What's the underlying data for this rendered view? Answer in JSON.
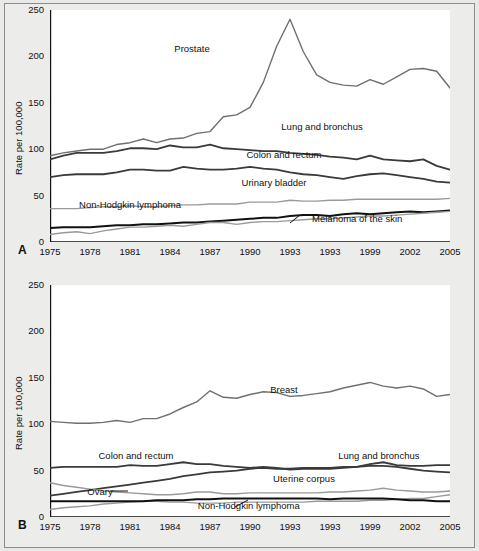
{
  "figure": {
    "background_color": "#e9e9e7",
    "plot_background_color": "#ffffff",
    "border_color": "#8c8c8a"
  },
  "panels": [
    {
      "letter": "A",
      "ylabel": "Rate per 100,000",
      "yticks": [
        "0",
        "50",
        "100",
        "150",
        "200",
        "250"
      ],
      "xticks": [
        "1975",
        "1978",
        "1981",
        "1984",
        "1987",
        "1990",
        "1993",
        "1993",
        "1999",
        "2002",
        "2005"
      ],
      "labels": [
        {
          "text": "Prostate",
          "x": 0.355,
          "y": 0.165
        },
        {
          "text": "Lung and bronchus",
          "x": 0.68,
          "y": 0.498
        },
        {
          "text": "Colon and rectum",
          "x": 0.585,
          "y": 0.62
        },
        {
          "text": "Urinary bladder",
          "x": 0.56,
          "y": 0.74
        },
        {
          "text": "Non-Hodgkin lymphoma",
          "x": 0.2,
          "y": 0.838
        },
        {
          "text": "Melanoma of the skin",
          "x": 0.768,
          "y": 0.898
        }
      ]
    },
    {
      "letter": "B",
      "ylabel": "Rate per 100,000",
      "yticks": [
        "0",
        "50",
        "100",
        "150",
        "200",
        "250"
      ],
      "xticks": [
        "1975",
        "1978",
        "1981",
        "1984",
        "1987",
        "1990",
        "1993",
        "1993",
        "1999",
        "2002",
        "2005"
      ],
      "labels": [
        {
          "text": "Breast",
          "x": 0.585,
          "y": 0.45
        },
        {
          "text": "Colon and rectum",
          "x": 0.215,
          "y": 0.733
        },
        {
          "text": "Lung and bronchus",
          "x": 0.822,
          "y": 0.733
        },
        {
          "text": "Uterine corpus",
          "x": 0.635,
          "y": 0.832
        },
        {
          "text": "Ovary",
          "x": 0.125,
          "y": 0.89
        },
        {
          "text": "Non-Hodgkin lymphoma",
          "x": 0.497,
          "y": 0.948
        }
      ]
    }
  ],
  "chart_data": [
    {
      "type": "line",
      "panel": "A",
      "title": "",
      "xlabel": "",
      "ylabel": "Rate per 100,000",
      "xlim": [
        1975,
        2005
      ],
      "ylim": [
        0,
        250
      ],
      "grid": false,
      "legend": "inline-labels",
      "x": [
        1975,
        1976,
        1977,
        1978,
        1979,
        1980,
        1981,
        1982,
        1983,
        1984,
        1985,
        1986,
        1987,
        1988,
        1989,
        1990,
        1991,
        1992,
        1993,
        1994,
        1995,
        1996,
        1997,
        1998,
        1999,
        2000,
        2001,
        2002,
        2003,
        2004,
        2005
      ],
      "series": [
        {
          "name": "Prostate",
          "color": "#6f6f6f",
          "width": 1.4,
          "values": [
            93,
            96,
            98,
            100,
            100,
            105,
            107,
            111,
            107,
            111,
            112,
            117,
            119,
            135,
            137,
            145,
            172,
            211,
            240,
            205,
            180,
            172,
            169,
            168,
            175,
            170,
            178,
            186,
            187,
            184,
            166
          ]
        },
        {
          "name": "Lung and bronchus",
          "color": "#3a3a3a",
          "width": 1.8,
          "values": [
            89,
            93,
            96,
            96,
            96,
            98,
            101,
            101,
            100,
            104,
            102,
            102,
            105,
            101,
            100,
            99,
            98,
            98,
            96,
            95,
            94,
            92,
            91,
            89,
            93,
            89,
            88,
            87,
            89,
            82,
            78
          ]
        },
        {
          "name": "Colon and rectum",
          "color": "#3a3a3a",
          "width": 1.8,
          "values": [
            70,
            72,
            73,
            73,
            73,
            75,
            78,
            78,
            77,
            77,
            81,
            79,
            78,
            78,
            79,
            81,
            79,
            78,
            75,
            73,
            72,
            70,
            68,
            71,
            73,
            74,
            72,
            70,
            68,
            65,
            64
          ]
        },
        {
          "name": "Urinary bladder",
          "color": "#9a9a9a",
          "width": 1.4,
          "values": [
            36,
            36,
            36,
            37,
            38,
            38,
            39,
            38,
            38,
            39,
            40,
            40,
            41,
            41,
            41,
            43,
            43,
            43,
            45,
            44,
            44,
            45,
            45,
            46,
            46,
            46,
            46,
            46,
            46,
            46,
            47
          ]
        },
        {
          "name": "Non-Hodgkin lymphoma",
          "color": "#111111",
          "width": 2.0,
          "values": [
            15,
            16,
            16,
            16,
            17,
            18,
            18,
            19,
            19,
            20,
            21,
            21,
            22,
            23,
            24,
            25,
            26,
            26,
            28,
            29,
            29,
            28,
            30,
            31,
            30,
            31,
            32,
            33,
            32,
            33,
            34
          ]
        },
        {
          "name": "Melanoma of the skin",
          "color": "#9a9a9a",
          "width": 1.4,
          "values": [
            8,
            10,
            11,
            9,
            12,
            14,
            16,
            16,
            17,
            18,
            17,
            19,
            21,
            21,
            19,
            21,
            22,
            22,
            23,
            24,
            25,
            25,
            26,
            27,
            28,
            28,
            29,
            30,
            31,
            32,
            33
          ]
        }
      ]
    },
    {
      "type": "line",
      "panel": "B",
      "title": "",
      "xlabel": "",
      "ylabel": "Rate per 100,000",
      "xlim": [
        1975,
        2005
      ],
      "ylim": [
        0,
        250
      ],
      "grid": false,
      "legend": "inline-labels",
      "x": [
        1975,
        1976,
        1977,
        1978,
        1979,
        1980,
        1981,
        1982,
        1983,
        1984,
        1985,
        1986,
        1987,
        1988,
        1989,
        1990,
        1991,
        1992,
        1993,
        1994,
        1995,
        1996,
        1997,
        1998,
        1999,
        2000,
        2001,
        2002,
        2003,
        2004,
        2005
      ],
      "series": [
        {
          "name": "Breast",
          "color": "#6f6f6f",
          "width": 1.4,
          "values": [
            103,
            102,
            101,
            101,
            102,
            104,
            102,
            106,
            106,
            111,
            118,
            124,
            136,
            129,
            128,
            132,
            135,
            134,
            130,
            131,
            133,
            135,
            139,
            142,
            145,
            141,
            139,
            141,
            138,
            130,
            132
          ]
        },
        {
          "name": "Colon and rectum",
          "color": "#3a3a3a",
          "width": 1.8,
          "values": [
            53,
            54,
            54,
            54,
            54,
            54,
            56,
            55,
            55,
            57,
            59,
            57,
            57,
            55,
            54,
            53,
            54,
            53,
            51,
            52,
            52,
            52,
            53,
            54,
            55,
            55,
            54,
            52,
            50,
            49,
            48
          ]
        },
        {
          "name": "Lung and bronchus",
          "color": "#3a3a3a",
          "width": 1.8,
          "values": [
            23,
            25,
            27,
            29,
            31,
            33,
            35,
            37,
            39,
            41,
            44,
            46,
            48,
            49,
            50,
            52,
            53,
            52,
            52,
            53,
            53,
            53,
            54,
            54,
            57,
            59,
            56,
            55,
            55,
            56,
            56
          ]
        },
        {
          "name": "Uterine corpus",
          "color": "#9a9a9a",
          "width": 1.4,
          "values": [
            37,
            34,
            32,
            30,
            28,
            27,
            26,
            25,
            24,
            24,
            25,
            27,
            27,
            25,
            25,
            26,
            26,
            26,
            26,
            26,
            26,
            27,
            27,
            28,
            29,
            31,
            29,
            28,
            27,
            27,
            28
          ]
        },
        {
          "name": "Ovary",
          "color": "#9a9a9a",
          "width": 1.4,
          "values": [
            8,
            10,
            11,
            12,
            14,
            15,
            16,
            17,
            17,
            16,
            16,
            15,
            15,
            15,
            16,
            16,
            16,
            16,
            16,
            16,
            17,
            17,
            17,
            17,
            18,
            18,
            19,
            20,
            20,
            22,
            24
          ]
        },
        {
          "name": "Non-Hodgkin lymphoma",
          "color": "#111111",
          "width": 2.0,
          "values": [
            17,
            17,
            17,
            17,
            17,
            17,
            17,
            17,
            18,
            18,
            18,
            19,
            19,
            20,
            20,
            20,
            20,
            20,
            20,
            20,
            20,
            19,
            20,
            20,
            20,
            20,
            19,
            18,
            18,
            17,
            17
          ]
        }
      ]
    }
  ]
}
